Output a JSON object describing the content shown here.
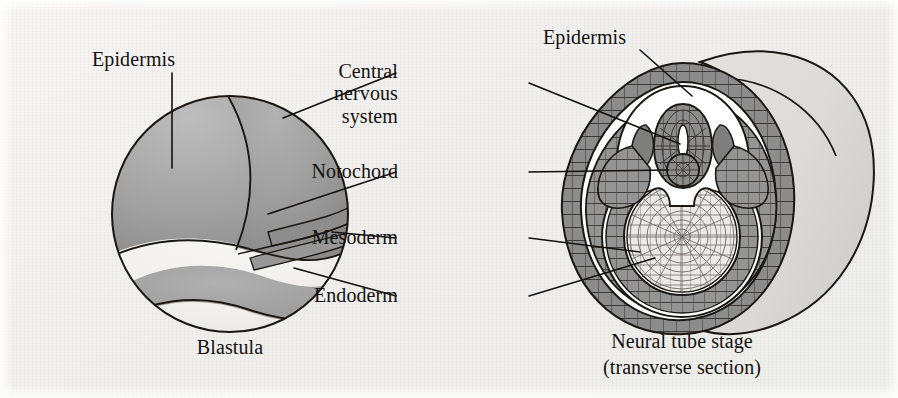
{
  "figure": {
    "background_color": "#f0efed",
    "ink_color": "#14110f",
    "width": 898,
    "height": 398
  },
  "palette": {
    "epidermis_gray": "#9a9a9a",
    "mesoderm_gray": "#8f8f8f",
    "cns_gray": "#8a8a8a",
    "endoderm_light": "#e9e8e6",
    "body_light": "#dcdbd8",
    "white": "#ffffff",
    "outline": "#1a1714"
  },
  "labels": {
    "blastula_epidermis": "Epidermis",
    "central_nervous_system": "Central\nnervous\nsystem",
    "notochord": "Notochord",
    "mesoderm": "Mesoderm",
    "endoderm": "Endoderm",
    "neural_epidermis": "Epidermis",
    "blastula_caption": "Blastula",
    "neural_caption_line1": "Neural tube stage",
    "neural_caption_line2": "(transverse section)"
  },
  "diagrams": [
    {
      "id": "blastula",
      "caption": "Blastula",
      "description": "Spherical early embryo with fate-mapped territories",
      "regions": [
        {
          "name": "epidermis",
          "shade": "#9a9a9a"
        },
        {
          "name": "central-nervous-system",
          "shade": "#8d8d8d"
        },
        {
          "name": "notochord",
          "shade": "#8a8a8a"
        },
        {
          "name": "mesoderm",
          "shade": "#929292"
        },
        {
          "name": "endoderm",
          "shade": "#ededeb"
        }
      ]
    },
    {
      "id": "neural-tube",
      "caption": "Neural tube stage (transverse section)",
      "description": "Transverse section through embryo at neural tube stage",
      "regions": [
        {
          "name": "epidermis",
          "shade": "#9a9a9a"
        },
        {
          "name": "neural-tube",
          "shade": "#8a8a8a"
        },
        {
          "name": "notochord",
          "shade": "#8a8a8a"
        },
        {
          "name": "mesoderm",
          "shade": "#8f8f8f"
        },
        {
          "name": "endoderm",
          "shade": "#eae9e7"
        },
        {
          "name": "body-trunk",
          "shade": "#dcdbd8"
        }
      ]
    }
  ],
  "leader_lines": [
    {
      "from": "blastula_epidermis",
      "to": "blastula-epidermis-region"
    },
    {
      "from": "central_nervous_system",
      "to": "blastula-cns-region"
    },
    {
      "from": "central_nervous_system",
      "to": "neural-tube-lumen"
    },
    {
      "from": "notochord",
      "to": "blastula-notochord-region"
    },
    {
      "from": "notochord",
      "to": "neural-tube-notochord"
    },
    {
      "from": "mesoderm",
      "to": "blastula-mesoderm-region"
    },
    {
      "from": "mesoderm",
      "to": "neural-tube-mesoderm-ring"
    },
    {
      "from": "endoderm",
      "to": "blastula-endoderm-region"
    },
    {
      "from": "endoderm",
      "to": "neural-tube-endoderm-core"
    },
    {
      "from": "neural_epidermis",
      "to": "neural-tube-epidermis-ring"
    }
  ]
}
